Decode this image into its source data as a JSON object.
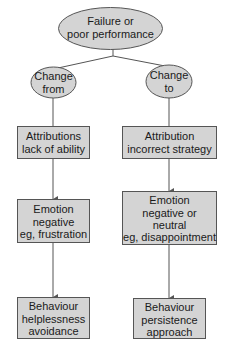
{
  "diagram": {
    "colors": {
      "node_fill": "#d4d4d4",
      "node_stroke": "#555555",
      "text": "#1a1a1a",
      "background": "#ffffff"
    },
    "root": {
      "shape": "ellipse",
      "lines": [
        "Failure or",
        "poor performance"
      ]
    },
    "branches": [
      {
        "id": "left",
        "head": {
          "shape": "ellipse",
          "lines": [
            "Change",
            "from"
          ]
        },
        "boxes": [
          {
            "lines": [
              "Attributions",
              "lack of ability"
            ]
          },
          {
            "lines": [
              "Emotion",
              "negative",
              "eg, frustration"
            ]
          },
          {
            "lines": [
              "Behaviour",
              "helplessness",
              "avoidance"
            ]
          }
        ]
      },
      {
        "id": "right",
        "head": {
          "shape": "ellipse",
          "lines": [
            "Change",
            "to"
          ]
        },
        "boxes": [
          {
            "lines": [
              "Attribution",
              "incorrect strategy"
            ]
          },
          {
            "lines": [
              "Emotion",
              "negative or",
              "neutral",
              "eg, disappointment"
            ]
          },
          {
            "lines": [
              "Behaviour",
              "persistence",
              "approach"
            ]
          }
        ]
      }
    ]
  }
}
